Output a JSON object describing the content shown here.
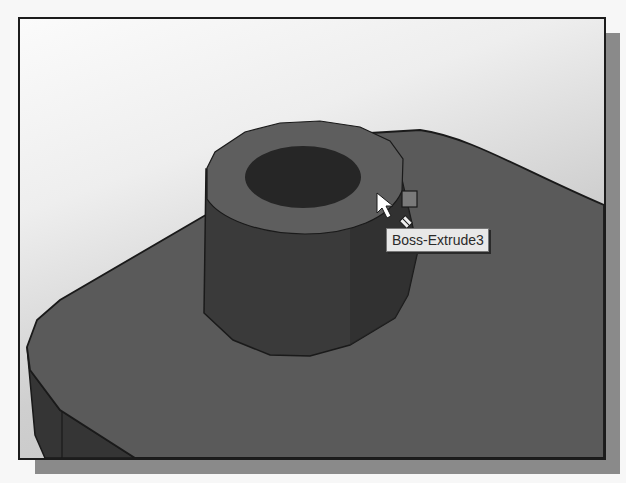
{
  "graphics_area": {
    "model": {
      "features": [
        {
          "name": "base-plate",
          "kind": "extrude"
        },
        {
          "name": "boss-cylinder",
          "kind": "boss-extrude",
          "has_hole": true
        }
      ]
    },
    "colors": {
      "background_light": "#fbfbfb",
      "background_dark": "#bdbdbd",
      "plate_top": "#5a5a5a",
      "plate_side": "#353535",
      "boss_rim": "#5e5e5e",
      "boss_wall": "#3a3a3a",
      "boss_hole": "#262626",
      "edge": "#1a1a1a"
    },
    "cursor": {
      "icon": "arrow-cursor-icon",
      "badge_icons": [
        "face-select-icon",
        "feature-diamond-icon"
      ]
    },
    "tooltip": {
      "label": "Boss-Extrude3"
    }
  }
}
